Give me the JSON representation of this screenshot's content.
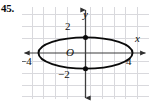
{
  "figure": {
    "problem_number": "45.",
    "origin_label": "O",
    "x_axis_label": "x",
    "y_axis_label": "y",
    "x_tick_left": "−4",
    "x_tick_right": "4",
    "y_tick_top": "2",
    "y_tick_bottom": "−2",
    "colors": {
      "curve": "#0a0a0a",
      "axis": "#3c3c3c",
      "grid": "#d8d8dc",
      "text": "#101010",
      "background": "#ffffff"
    }
  },
  "chart_data": {
    "type": "line",
    "title": "",
    "subtitle": "",
    "xlabel": "x",
    "ylabel": "y",
    "curve_name": "ellipse",
    "equation": "x^2/16 + y^2/1 = 1",
    "semi_major_axis_a": 4,
    "semi_minor_axis_b": 1,
    "center": [
      0,
      0
    ],
    "x_intercepts": [
      -4,
      4
    ],
    "y_intercepts": [
      0,
      1
    ],
    "marked_points": [
      {
        "x": 0,
        "y": 1,
        "style": "filled-dot"
      },
      {
        "x": 0,
        "y": -1,
        "style": "filled-dot"
      }
    ],
    "xlim": [
      -5.4,
      5.4
    ],
    "ylim": [
      -3.2,
      3.2
    ],
    "x_tick_labels": [
      {
        "value": -4,
        "text": "−4"
      },
      {
        "value": 4,
        "text": "4"
      }
    ],
    "y_tick_labels": [
      {
        "value": 2,
        "text": "2"
      },
      {
        "value": -2,
        "text": "−2"
      }
    ],
    "grid": true,
    "grid_spacing_x": 1,
    "grid_spacing_y": 1,
    "legend": "none",
    "axis_arrows": [
      "left",
      "right",
      "up",
      "down"
    ],
    "annotations": [
      {
        "text": "O",
        "x": 0,
        "y": 0,
        "role": "origin-label"
      }
    ]
  }
}
